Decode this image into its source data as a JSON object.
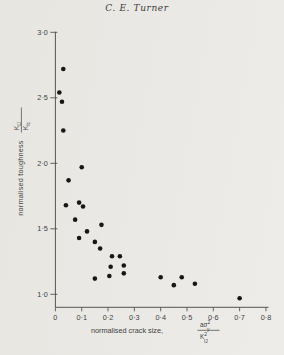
{
  "page": {
    "header_title": "C. E. Turner",
    "background": "#e9e8e4",
    "axis_color": "#555550",
    "text_color": "#3f3f3f",
    "dot_color": "#171715"
  },
  "chart_data": {
    "type": "scatter",
    "title": "",
    "xlabel": {
      "prefix": "normalised crack size,",
      "fraction": {
        "num_base": "aσ",
        "num_sup": "2",
        "num_sub": "y",
        "den_base": "K",
        "den_sup": "2",
        "den_sub": "IJ"
      }
    },
    "ylabel": {
      "prefix": "normalised toughness",
      "fraction": {
        "num_base": "K",
        "num_sub": "IJ",
        "den_base": "K",
        "den_sub": "Ic"
      }
    },
    "xlim": [
      0,
      0.8
    ],
    "ylim": [
      0.9,
      3.0
    ],
    "grid": false,
    "legend": "none",
    "x_ticks": [
      {
        "v": 0.0,
        "label": "0"
      },
      {
        "v": 0.1,
        "label": "0·1"
      },
      {
        "v": 0.2,
        "label": "0·2"
      },
      {
        "v": 0.3,
        "label": "0·3"
      },
      {
        "v": 0.4,
        "label": "0·4"
      },
      {
        "v": 0.5,
        "label": "0·5"
      },
      {
        "v": 0.6,
        "label": "0·6"
      },
      {
        "v": 0.7,
        "label": "0·7"
      },
      {
        "v": 0.8,
        "label": "0·8"
      }
    ],
    "y_ticks": [
      {
        "v": 1.0,
        "label": "1·0"
      },
      {
        "v": 1.5,
        "label": "1·5"
      },
      {
        "v": 2.0,
        "label": "2·0"
      },
      {
        "v": 2.5,
        "label": "2·5"
      },
      {
        "v": 3.0,
        "label": "3·0"
      }
    ],
    "points": [
      [
        0.03,
        2.72
      ],
      [
        0.015,
        2.54
      ],
      [
        0.025,
        2.47
      ],
      [
        0.03,
        2.25
      ],
      [
        0.05,
        1.87
      ],
      [
        0.04,
        1.68
      ],
      [
        0.1,
        1.97
      ],
      [
        0.09,
        1.7
      ],
      [
        0.105,
        1.67
      ],
      [
        0.075,
        1.57
      ],
      [
        0.09,
        1.43
      ],
      [
        0.12,
        1.48
      ],
      [
        0.15,
        1.4
      ],
      [
        0.17,
        1.35
      ],
      [
        0.175,
        1.53
      ],
      [
        0.215,
        1.29
      ],
      [
        0.245,
        1.29
      ],
      [
        0.21,
        1.21
      ],
      [
        0.26,
        1.22
      ],
      [
        0.26,
        1.16
      ],
      [
        0.205,
        1.14
      ],
      [
        0.15,
        1.12
      ],
      [
        0.4,
        1.13
      ],
      [
        0.45,
        1.07
      ],
      [
        0.48,
        1.13
      ],
      [
        0.53,
        1.08
      ],
      [
        0.7,
        0.97
      ]
    ]
  }
}
